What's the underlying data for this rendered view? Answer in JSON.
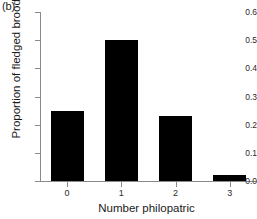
{
  "panel": {
    "label": "(b)"
  },
  "chart_data": {
    "type": "bar",
    "title": "",
    "subtitle": "",
    "xlabel": "Number philopatric",
    "ylabel": "Proportion of fledged broods",
    "categories": [
      "0",
      "1",
      "2",
      "3"
    ],
    "values": [
      0.25,
      0.5,
      0.23,
      0.02
    ],
    "series": [
      {
        "name": "Proportion of fledged broods",
        "values": [
          0.25,
          0.5,
          0.23,
          0.02
        ]
      }
    ],
    "ylim": [
      0.0,
      0.6
    ],
    "xlim": [
      -0.5,
      3.5
    ],
    "yticks": [
      "0.0",
      "0.1",
      "0.2",
      "0.3",
      "0.4",
      "0.5",
      "0.6"
    ],
    "ytick_values": [
      0.0,
      0.1,
      0.2,
      0.3,
      0.4,
      0.5,
      0.6
    ],
    "xticks": [
      "0",
      "1",
      "2",
      "3"
    ],
    "grid": false,
    "legend": false,
    "legend_position": "none",
    "bar_color": "#000000",
    "axis_color": "#8a8a8a",
    "text_color": "#1a1a1a",
    "annotations": []
  }
}
